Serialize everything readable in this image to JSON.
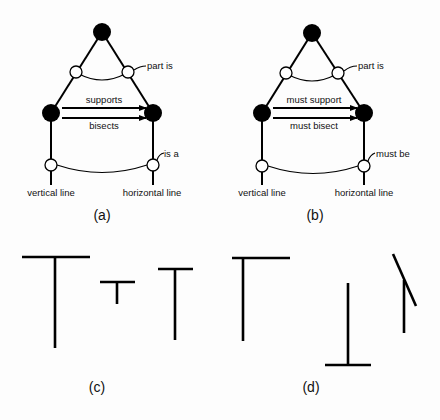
{
  "figure": {
    "panels": [
      {
        "id": "a",
        "caption": "(a)",
        "nodes": {
          "top": "filled",
          "left": "filled",
          "right": "filled"
        },
        "relations": {
          "upper": "part is",
          "arrow_top": "supports",
          "arrow_bottom": "bisects",
          "lower": "is a"
        },
        "leaf_labels": {
          "left": "vertical line",
          "right": "horizontal line"
        }
      },
      {
        "id": "b",
        "caption": "(b)",
        "nodes": {
          "top": "filled",
          "left": "filled",
          "right": "filled"
        },
        "relations": {
          "upper": "part is",
          "arrow_top": "must support",
          "arrow_bottom": "must bisect",
          "lower": "must be"
        },
        "leaf_labels": {
          "left": "vertical line",
          "right": "horizontal line"
        }
      },
      {
        "id": "c",
        "caption": "(c)",
        "description": "three upright T shapes of different sizes (positive examples)"
      },
      {
        "id": "d",
        "caption": "(d)",
        "description": "T-like shapes violating constraints: off-center stem, inverted T, tilted bar (near misses)"
      }
    ],
    "colors": {
      "ink": "#000000",
      "background": "#fdfdfd"
    }
  }
}
